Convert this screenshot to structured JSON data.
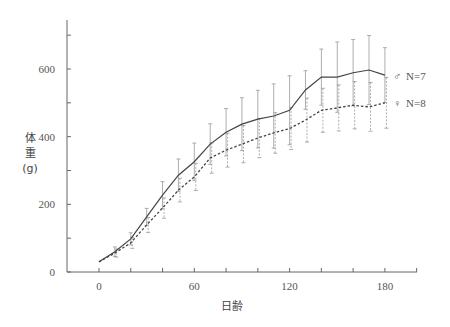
{
  "chart_data": {
    "type": "line",
    "title": "",
    "xlabel": "日齢",
    "ylabel": "体重 (g)",
    "ylabel_lines": [
      "体",
      "重",
      "(g)"
    ],
    "xlim": [
      -20,
      200
    ],
    "ylim": [
      0,
      740
    ],
    "x_ticks": [
      0,
      60,
      120,
      180
    ],
    "x_minor_ticks": [
      0,
      20,
      40,
      60,
      80,
      100,
      120,
      140,
      160,
      180,
      200
    ],
    "y_ticks": [
      0,
      200,
      400,
      600
    ],
    "y_minor_ticks": [
      0,
      100,
      200,
      300,
      400,
      500,
      600,
      700
    ],
    "grid": false,
    "legend_position": "right, inline at series ends",
    "x": [
      0,
      10,
      20,
      30,
      40,
      50,
      60,
      70,
      80,
      90,
      100,
      110,
      120,
      130,
      140,
      150,
      160,
      170,
      180
    ],
    "series": [
      {
        "name": "♂ N=7",
        "symbol": "♂",
        "n_label": "N=7",
        "style": "solid",
        "color": "#444444",
        "values": [
          30,
          60,
          98,
          163,
          227,
          286,
          326,
          378,
          413,
          437,
          452,
          461,
          478,
          538,
          576,
          576,
          589,
          597,
          582
        ],
        "error": [
          8,
          14,
          18,
          25,
          40,
          48,
          55,
          60,
          70,
          78,
          85,
          95,
          102,
          57,
          83,
          104,
          98,
          102,
          81
        ]
      },
      {
        "name": "♀ N=8",
        "symbol": "♀",
        "n_label": "N=8",
        "style": "dashed",
        "color": "#444444",
        "values": [
          30,
          56,
          86,
          139,
          189,
          242,
          281,
          337,
          360,
          378,
          396,
          411,
          424,
          449,
          478,
          485,
          493,
          488,
          500
        ],
        "error": [
          6,
          12,
          16,
          22,
          30,
          35,
          40,
          45,
          50,
          55,
          58,
          60,
          62,
          65,
          65,
          68,
          70,
          72,
          75
        ]
      }
    ]
  }
}
